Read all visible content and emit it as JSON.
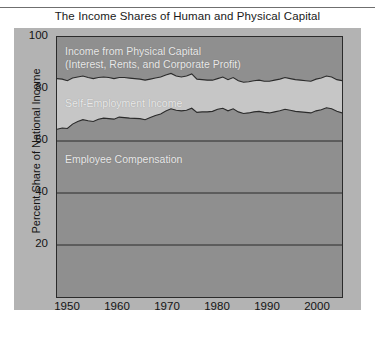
{
  "figure": {
    "title": "The Income Shares of Human and Physical Capital"
  },
  "axes": {
    "ylabel": "Percent Share of National Income",
    "yticks": [
      "20",
      "40",
      "60",
      "80",
      "100"
    ],
    "xticks": [
      "1950",
      "1960",
      "1970",
      "1980",
      "1990",
      "2000"
    ]
  },
  "labels": {
    "physical_line1": "Income from Physical Capital",
    "physical_line2": "(Interest, Rents, and Corporate Profit)",
    "self_employment": "Self-Employment Income",
    "employee": "Employee Compensation"
  },
  "colors": {
    "figure_background": "#b3b3b3",
    "employee_band": "#8f8f8f",
    "self_employment_band": "#c6c6c6",
    "physical_capital_band": "#8f8f8f",
    "axis_line": "#2b2b2b",
    "text": "#141414",
    "band_label_text": "#ebebeb"
  },
  "chart_data": {
    "type": "area",
    "stacked": true,
    "title": "The Income Shares of Human and Physical Capital",
    "xlabel": "",
    "ylabel": "Percent Share of National Income",
    "xlim": [
      1948,
      2003
    ],
    "ylim": [
      0,
      100
    ],
    "grid": true,
    "legend": "inline-band-labels",
    "x": [
      1948,
      1949,
      1950,
      1951,
      1952,
      1953,
      1954,
      1955,
      1956,
      1957,
      1958,
      1959,
      1960,
      1961,
      1962,
      1963,
      1964,
      1965,
      1966,
      1967,
      1968,
      1969,
      1970,
      1971,
      1972,
      1973,
      1974,
      1975,
      1976,
      1977,
      1978,
      1979,
      1980,
      1981,
      1982,
      1983,
      1984,
      1985,
      1986,
      1987,
      1988,
      1989,
      1990,
      1991,
      1992,
      1993,
      1994,
      1995,
      1996,
      1997,
      1998,
      1999,
      2000,
      2001,
      2002,
      2003
    ],
    "series": [
      {
        "name": "Employee Compensation",
        "comment": "cumulative upper boundary = employee compensation share",
        "values": [
          64.5,
          65.0,
          64.8,
          66.5,
          67.5,
          68.2,
          67.8,
          67.5,
          68.4,
          68.8,
          68.6,
          68.4,
          69.2,
          69.0,
          68.8,
          68.7,
          68.6,
          68.2,
          69.0,
          69.8,
          70.4,
          71.5,
          72.4,
          71.8,
          71.6,
          71.8,
          72.6,
          71.0,
          71.2,
          71.2,
          71.4,
          72.2,
          72.6,
          71.6,
          72.4,
          71.2,
          70.6,
          70.8,
          71.2,
          71.4,
          71.0,
          70.8,
          71.2,
          71.6,
          72.2,
          71.8,
          71.4,
          71.2,
          71.0,
          70.8,
          71.6,
          72.0,
          72.8,
          72.4,
          71.4,
          70.8
        ]
      },
      {
        "name": "Self-Employment Income",
        "comment": "cumulative upper boundary = employee + self-employment",
        "values": [
          84.0,
          83.8,
          83.2,
          84.2,
          84.6,
          85.0,
          84.4,
          84.0,
          84.4,
          84.6,
          84.4,
          84.0,
          84.4,
          84.4,
          84.2,
          84.0,
          83.8,
          83.4,
          83.8,
          84.2,
          84.6,
          85.4,
          86.0,
          85.0,
          84.6,
          85.0,
          85.8,
          83.8,
          83.6,
          83.4,
          83.4,
          84.0,
          84.6,
          83.6,
          84.4,
          83.2,
          82.6,
          82.8,
          83.2,
          83.4,
          83.0,
          83.0,
          83.4,
          83.8,
          84.4,
          84.0,
          83.6,
          83.4,
          83.2,
          83.0,
          83.8,
          84.2,
          85.0,
          84.6,
          83.6,
          83.2
        ]
      },
      {
        "name": "Income from Physical Capital (Interest, Rents, and Corporate Profit)",
        "comment": "cumulative upper boundary = 100 (top of chart)",
        "values": [
          100,
          100,
          100,
          100,
          100,
          100,
          100,
          100,
          100,
          100,
          100,
          100,
          100,
          100,
          100,
          100,
          100,
          100,
          100,
          100,
          100,
          100,
          100,
          100,
          100,
          100,
          100,
          100,
          100,
          100,
          100,
          100,
          100,
          100,
          100,
          100,
          100,
          100,
          100,
          100,
          100,
          100,
          100,
          100,
          100,
          100,
          100,
          100,
          100,
          100,
          100,
          100,
          100,
          100,
          100,
          100
        ]
      }
    ]
  }
}
